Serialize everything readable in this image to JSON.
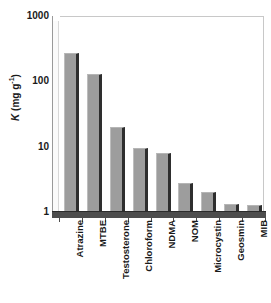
{
  "chart_data": {
    "type": "bar",
    "title": "",
    "subtitle": "",
    "xlabel": "",
    "ylabel": "K (mg g-1)",
    "ylabel_parts": {
      "symbol": "K",
      "unit_prefix": " (mg g",
      "unit_exponent": "-1",
      "unit_suffix": ")"
    },
    "yscale": "log",
    "ylim": [
      1,
      1000
    ],
    "ytick_labels": [
      "1000",
      "100",
      "10",
      "1"
    ],
    "ytick_values": [
      1000,
      100,
      10,
      1
    ],
    "grid": false,
    "legend": null,
    "categories": [
      "Atrazine",
      "MTBE",
      "Testosterone",
      "Chloroform",
      "NDMA",
      "NOM",
      "Microcystin",
      "Geosmin",
      "MIB"
    ],
    "values": [
      270,
      130,
      20,
      9.5,
      8,
      2.8,
      2.0,
      1.35,
      1.3
    ],
    "bar_color": "#9d9d9d",
    "bar_edge_color": "#2e2e2e",
    "axis_color": "#4d4d4d",
    "text_color": "#1a1a1a",
    "background_color": "#ffffff"
  }
}
